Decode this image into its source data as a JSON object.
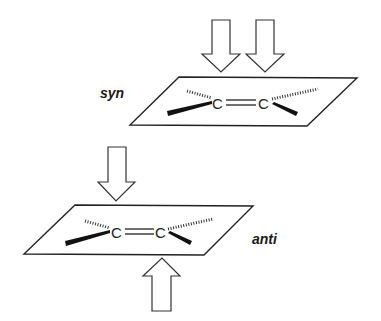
{
  "diagram": {
    "type": "stereochemistry-addition-faces",
    "colors": {
      "line": "#222222",
      "background": "#ffffff"
    },
    "panels": [
      {
        "id": "syn",
        "label": "syn",
        "atoms": [
          "C",
          "C"
        ],
        "bond": "double",
        "attack_arrows": [
          "top",
          "top"
        ],
        "description": "Both reagents approach from the same face of the alkene plane"
      },
      {
        "id": "anti",
        "label": "anti",
        "atoms": [
          "C",
          "C"
        ],
        "bond": "double",
        "attack_arrows": [
          "top",
          "bottom"
        ],
        "description": "Reagents approach from opposite faces of the alkene plane"
      }
    ]
  }
}
